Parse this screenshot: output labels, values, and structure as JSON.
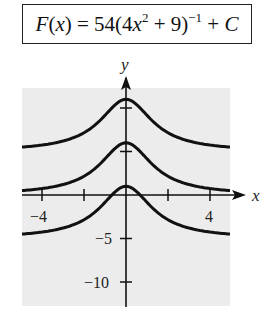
{
  "formula": {
    "lhs": "F(x)",
    "text": "F(x) = 54(4x^2 + 9)^-1 + C",
    "coef": "54",
    "inner": "(4x",
    "exp2": "2",
    "inner_tail": " + 9)",
    "exp_neg1": "−1",
    "tail": " + C"
  },
  "chart_data": {
    "type": "line",
    "xlabel": "x",
    "ylabel": "y",
    "xlim": [
      -5,
      5
    ],
    "ylim": [
      -12,
      12
    ],
    "x_ticks": [
      -4,
      -2,
      2,
      4
    ],
    "x_tick_labels": [
      "-4",
      "4"
    ],
    "y_ticks": [
      -10,
      -5,
      5,
      10
    ],
    "y_tick_labels": [
      "-5",
      "-10"
    ],
    "grid": false,
    "background": "#eeeeee",
    "series": [
      {
        "name": "C = 5",
        "C": 5,
        "x": [
          -5,
          -4,
          -3,
          -2,
          -1,
          0,
          1,
          2,
          3,
          4,
          5
        ],
        "values": [
          5.49,
          5.74,
          6.2,
          7.16,
          9.15,
          11,
          9.15,
          7.16,
          6.2,
          5.74,
          5.49
        ]
      },
      {
        "name": "C = 0",
        "C": 0,
        "x": [
          -5,
          -4,
          -3,
          -2,
          -1,
          0,
          1,
          2,
          3,
          4,
          5
        ],
        "values": [
          0.49,
          0.74,
          1.2,
          2.16,
          4.15,
          6,
          4.15,
          2.16,
          1.2,
          0.74,
          0.49
        ]
      },
      {
        "name": "C = -5",
        "C": -5,
        "x": [
          -5,
          -4,
          -3,
          -2,
          -1,
          0,
          1,
          2,
          3,
          4,
          5
        ],
        "values": [
          -4.51,
          -4.26,
          -3.8,
          -2.84,
          -0.85,
          1,
          -0.85,
          -2.84,
          -3.8,
          -4.26,
          -4.51
        ]
      }
    ]
  },
  "axis_labels": {
    "x": "x",
    "y": "y",
    "xm4": "−4",
    "x4": "4",
    "ym5": "−5",
    "ym10": "−10"
  }
}
